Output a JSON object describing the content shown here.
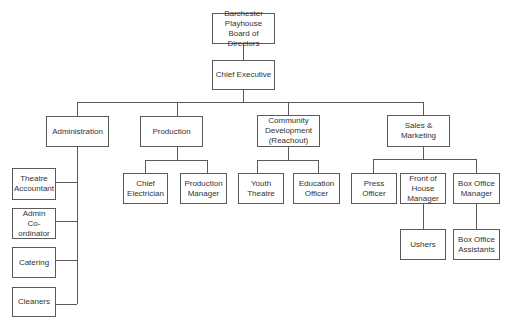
{
  "diagram": {
    "type": "org-chart",
    "nodes": {
      "board": "Barchester\nPlayhouse\nBoard of Directors",
      "chief_executive": "Chief Executive",
      "administration": "Administration",
      "production": "Production",
      "community": "Community\nDevelopment\n(Reachout)",
      "sales": "Sales &\nMarketing",
      "theatre_accountant": "Theatre\nAccountant",
      "admin_coordinator": "Admin\nCo-ordinator",
      "catering": "Catering",
      "cleaners": "Cleaners",
      "chief_electrician": "Chief\nElectrician",
      "production_manager": "Production\nManager",
      "youth_theatre": "Youth\nTheatre",
      "education_officer": "Education\nOfficer",
      "press_officer": "Press\nOfficer",
      "front_of_house": "Front of\nHouse\nManager",
      "box_office_manager": "Box Office\nManager",
      "ushers": "Ushers",
      "box_office_assistants": "Box Office\nAssistants"
    },
    "edges": [
      [
        "board",
        "chief_executive"
      ],
      [
        "chief_executive",
        "administration"
      ],
      [
        "chief_executive",
        "production"
      ],
      [
        "chief_executive",
        "community"
      ],
      [
        "chief_executive",
        "sales"
      ],
      [
        "administration",
        "theatre_accountant"
      ],
      [
        "administration",
        "admin_coordinator"
      ],
      [
        "administration",
        "catering"
      ],
      [
        "administration",
        "cleaners"
      ],
      [
        "production",
        "chief_electrician"
      ],
      [
        "production",
        "production_manager"
      ],
      [
        "community",
        "youth_theatre"
      ],
      [
        "community",
        "education_officer"
      ],
      [
        "sales",
        "press_officer"
      ],
      [
        "sales",
        "front_of_house"
      ],
      [
        "sales",
        "box_office_manager"
      ],
      [
        "front_of_house",
        "ushers"
      ],
      [
        "box_office_manager",
        "box_office_assistants"
      ]
    ]
  }
}
